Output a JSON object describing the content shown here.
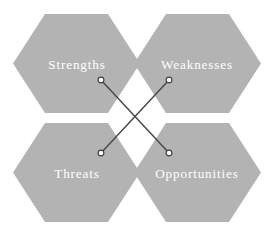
{
  "diagram": {
    "type": "swot-hexagon-diagram",
    "canvas": {
      "width": 274,
      "height": 236,
      "background_color": "#ffffff"
    },
    "style": {
      "hexagon_fill": "#b3b3b3",
      "label_color": "#ffffff",
      "connector_color": "#4a4a4a",
      "node_fill": "#ffffff",
      "node_stroke": "#3c3c3c"
    },
    "quadrants": [
      {
        "key": "strengths",
        "label": "Strengths",
        "position": "top-left",
        "center_x": 77,
        "center_y": 64,
        "node_x": 101,
        "node_y": 80
      },
      {
        "key": "weaknesses",
        "label": "Weaknesses",
        "position": "top-right",
        "center_x": 197,
        "center_y": 64,
        "node_x": 169,
        "node_y": 80
      },
      {
        "key": "threats",
        "label": "Threats",
        "position": "bottom-left",
        "center_x": 77,
        "center_y": 173,
        "node_x": 101,
        "node_y": 153
      },
      {
        "key": "opportunities",
        "label": "Opportunities",
        "position": "bottom-right",
        "center_x": 197,
        "center_y": 173,
        "node_x": 169,
        "node_y": 153
      }
    ],
    "connectors": [
      {
        "key": "strengths-to-opportunities",
        "from": "strengths",
        "to": "opportunities",
        "x1": 101,
        "y1": 80,
        "x2": 169,
        "y2": 153
      },
      {
        "key": "weaknesses-to-threats",
        "from": "weaknesses",
        "to": "threats",
        "x1": 169,
        "y1": 80,
        "x2": 101,
        "y2": 153
      }
    ]
  }
}
